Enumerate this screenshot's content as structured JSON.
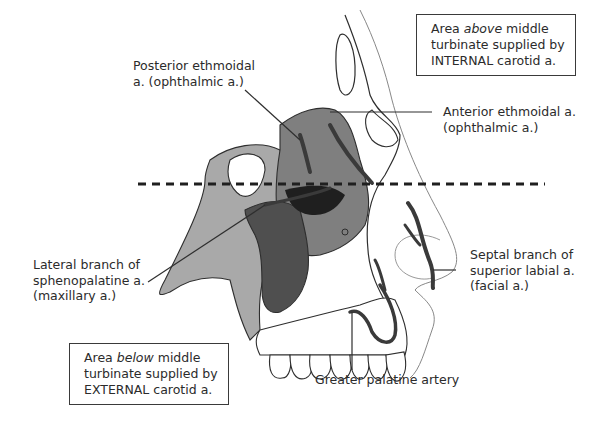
{
  "diagram": {
    "boxes": {
      "internal": {
        "line1_pre": "Area ",
        "line1_em": "above",
        "line1_post": " middle",
        "line2": "turbinate supplied by",
        "line3": "INTERNAL carotid a."
      },
      "external": {
        "line1_pre": "Area ",
        "line1_em": "below",
        "line1_post": " middle",
        "line2": "turbinate supplied by",
        "line3": "EXTERNAL carotid a."
      }
    },
    "labels": {
      "posterior_ethmoidal": {
        "line1": "Posterior ethmoidal",
        "line2": "a. (ophthalmic a.)"
      },
      "anterior_ethmoidal": {
        "line1": "Anterior ethmoidal a.",
        "line2": "(ophthalmic a.)"
      },
      "sphenopalatine": {
        "line1": "Lateral branch of",
        "line2": "sphenopalatine a.",
        "line3": "(maxillary a.)"
      },
      "septal_branch": {
        "line1": "Septal branch of",
        "line2": "superior labial a.",
        "line3": "(facial a.)"
      },
      "greater_palatine": {
        "line1": "Greater palatine artery"
      }
    },
    "divider": {
      "style": "dashed",
      "meaning": "level of middle turbinate"
    },
    "colors": {
      "light_region": "#a9a9a9",
      "mid_region": "#7a7a7a",
      "dark_region": "#4d4d4d",
      "artery": "#3a3a3a",
      "outline": "#2e2e2e"
    }
  }
}
